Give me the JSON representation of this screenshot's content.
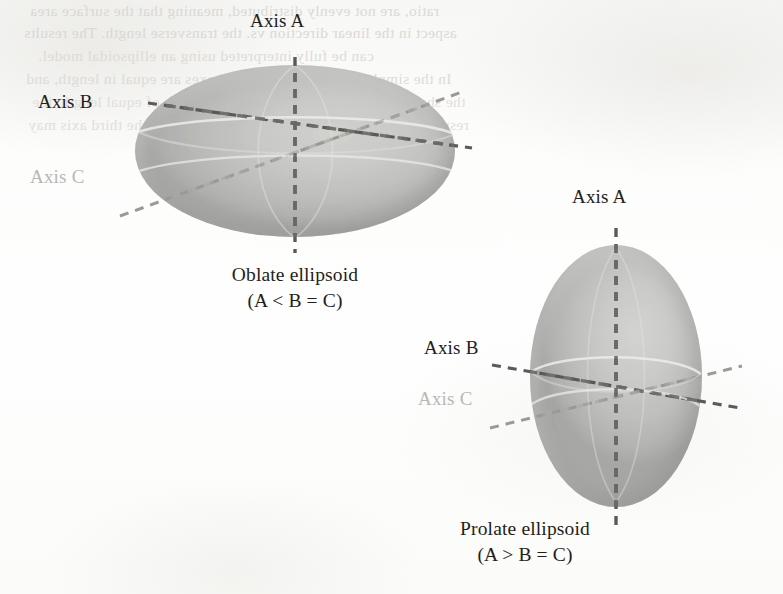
{
  "figure": {
    "background_color": "#fcfcfb",
    "body_fill_color": "#c6c6c4",
    "axis_dash_color": "#5b5a58",
    "faint_label_color": "#b9b8b4",
    "label_color": "#23211f"
  },
  "oblate": {
    "shape_name": "oblate-ellipsoid",
    "axis_a_label": "Axis A",
    "axis_b_label": "Axis B",
    "axis_c_label": "Axis C",
    "caption_name": "Oblate ellipsoid",
    "caption_relation": "(A < B = C)",
    "center": {
      "x": 295,
      "y": 151
    },
    "radius_x": 160,
    "radius_y": 86
  },
  "prolate": {
    "shape_name": "prolate-ellipsoid",
    "axis_a_label": "Axis A",
    "axis_b_label": "Axis B",
    "axis_c_label": "Axis C",
    "caption_name": "Prolate ellipsoid",
    "caption_relation": "(A > B = C)",
    "center": {
      "x": 616,
      "y": 376
    },
    "radius_x": 86,
    "radius_y": 131
  },
  "bleed_through": {
    "note": "faint mirrored show-through text from the reverse side of the scanned page",
    "lines": [
      "ratio, are not evenly distributed, meaning that the surface area",
      "aspect in the linear direction vs. the transverse length. The results",
      "can be fully interpreted using an ellipsoidal model.",
      "In the simplest case so far, all three axes are equal in length, and",
      "the shape is a sphere. If two of seven axes are of equal length, the",
      "resulting shape is an ellipsoid of revolution, and the third axis may"
    ]
  }
}
